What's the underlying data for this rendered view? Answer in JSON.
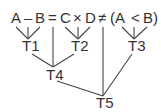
{
  "expression": {
    "tokens": [
      "A",
      "–",
      "B",
      "=",
      "C",
      "×",
      "D",
      "≠",
      "(A",
      "<",
      "B)"
    ]
  },
  "nodes": {
    "t1": "T1",
    "t2": "T2",
    "t3": "T3",
    "t4": "T4",
    "t5": "T5"
  },
  "colors": {
    "ink": "#333333",
    "background": "#ffffff"
  }
}
